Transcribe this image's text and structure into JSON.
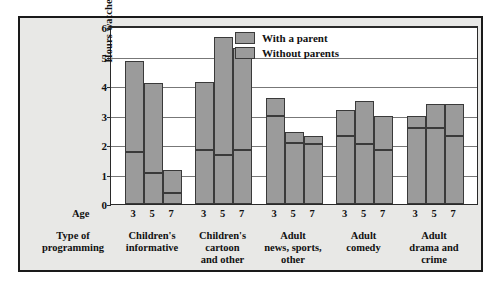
{
  "chart_data": {
    "type": "bar",
    "title": "",
    "subtitle": "",
    "xlabel": "Type of programming",
    "ylabel": "Hours watched per week",
    "age_axis_label": "Age",
    "ylim": [
      0,
      6
    ],
    "yticks": [
      "0",
      "1",
      "2",
      "3",
      "4",
      "5",
      "6"
    ],
    "grid": true,
    "legend_position": "top-right",
    "legend": [
      "With a parent",
      "Without parents"
    ],
    "ages": [
      "3",
      "5",
      "7"
    ],
    "categories": [
      "Children's informative",
      "Children's cartoon and other",
      "Adult news, sports, other",
      "Adult comedy",
      "Adult drama and crime"
    ],
    "category_lines": [
      [
        "Children's",
        "informative"
      ],
      [
        "Children's",
        "cartoon",
        "and other"
      ],
      [
        "Adult",
        "news, sports,",
        "other"
      ],
      [
        "Adult",
        "comedy"
      ],
      [
        "Adult",
        "drama and",
        "crime"
      ]
    ],
    "note": "Each bar is a stacked total of hours watched; lower segment = with a parent, upper segment = without parents.",
    "groups": [
      {
        "category": "Children's informative",
        "bars": [
          {
            "age": "3",
            "total": 4.85,
            "with_a_parent": 1.7,
            "without_parents": 3.15
          },
          {
            "age": "5",
            "total": 4.1,
            "with_a_parent": 1.0,
            "without_parents": 3.1
          },
          {
            "age": "7",
            "total": 1.15,
            "with_a_parent": 0.3,
            "without_parents": 0.85
          }
        ]
      },
      {
        "category": "Children's cartoon and other",
        "bars": [
          {
            "age": "3",
            "total": 4.15,
            "with_a_parent": 1.75,
            "without_parents": 2.4
          },
          {
            "age": "5",
            "total": 5.65,
            "with_a_parent": 1.6,
            "without_parents": 4.05
          },
          {
            "age": "7",
            "total": 5.3,
            "with_a_parent": 1.75,
            "without_parents": 3.55
          }
        ]
      },
      {
        "category": "Adult news, sports, other",
        "bars": [
          {
            "age": "3",
            "total": 3.6,
            "with_a_parent": 2.9,
            "without_parents": 0.7
          },
          {
            "age": "5",
            "total": 2.45,
            "with_a_parent": 2.0,
            "without_parents": 0.45
          },
          {
            "age": "7",
            "total": 2.3,
            "with_a_parent": 1.95,
            "without_parents": 0.35
          }
        ]
      },
      {
        "category": "Adult comedy",
        "bars": [
          {
            "age": "3",
            "total": 3.2,
            "with_a_parent": 2.25,
            "without_parents": 0.95
          },
          {
            "age": "5",
            "total": 3.5,
            "with_a_parent": 1.95,
            "without_parents": 1.55
          },
          {
            "age": "7",
            "total": 3.0,
            "with_a_parent": 1.75,
            "without_parents": 1.25
          }
        ]
      },
      {
        "category": "Adult drama and crime",
        "bars": [
          {
            "age": "3",
            "total": 3.0,
            "with_a_parent": 2.5,
            "without_parents": 0.5
          },
          {
            "age": "5",
            "total": 3.4,
            "with_a_parent": 2.5,
            "without_parents": 0.9
          },
          {
            "age": "7",
            "total": 3.4,
            "with_a_parent": 2.25,
            "without_parents": 1.15
          }
        ]
      }
    ],
    "colors": {
      "bar_fill": "#9b9b9b",
      "bar_edge": "#3a3a3a",
      "figure_background": "#e8e8e6",
      "plot_background": "#ffffff",
      "gridline": "#777777",
      "frame": "#1a1a1a",
      "text": "#111111"
    }
  }
}
